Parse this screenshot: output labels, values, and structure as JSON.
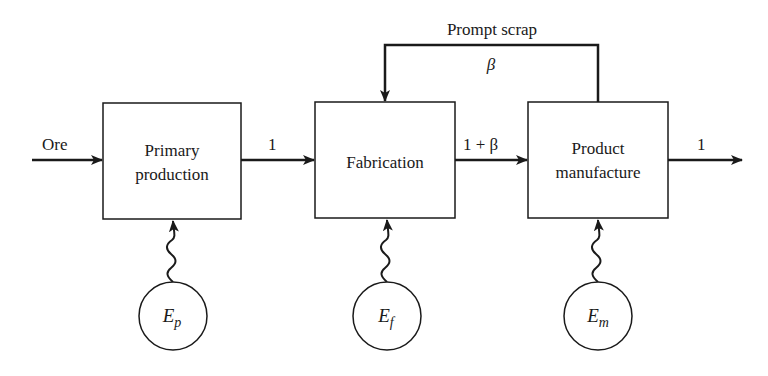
{
  "diagram": {
    "type": "flow",
    "colors": {
      "stroke": "#1a1a1a",
      "background": "#ffffff"
    },
    "nodes": [
      {
        "id": "primary",
        "line1": "Primary",
        "line2": "production"
      },
      {
        "id": "fabrication",
        "line1": "Fabrication"
      },
      {
        "id": "manufacture",
        "line1": "Product",
        "line2": "manufacture"
      }
    ],
    "energy": [
      {
        "id": "ep",
        "symbol": "E",
        "sub": "p"
      },
      {
        "id": "ef",
        "symbol": "E",
        "sub": "f"
      },
      {
        "id": "em",
        "symbol": "E",
        "sub": "m"
      }
    ],
    "edges": {
      "input_label": "Ore",
      "primary_to_fab": "1",
      "fab_to_manuf": "1 + β",
      "output_label": "1",
      "feedback_title": "Prompt scrap",
      "feedback_value": "β"
    }
  }
}
